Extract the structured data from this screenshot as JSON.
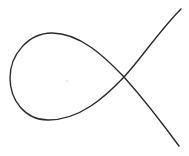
{
  "diagram": {
    "type": "nodal-cubic-curve",
    "stroke_color": "#2a2a2a",
    "background": "#ffffff",
    "node_point": [
      124,
      77
    ],
    "loop_leftmost": [
      10,
      80
    ],
    "upper_branch_end": [
      181,
      9
    ],
    "lower_branch_end": [
      179,
      146
    ],
    "interior_dot": [
      67,
      81
    ]
  }
}
